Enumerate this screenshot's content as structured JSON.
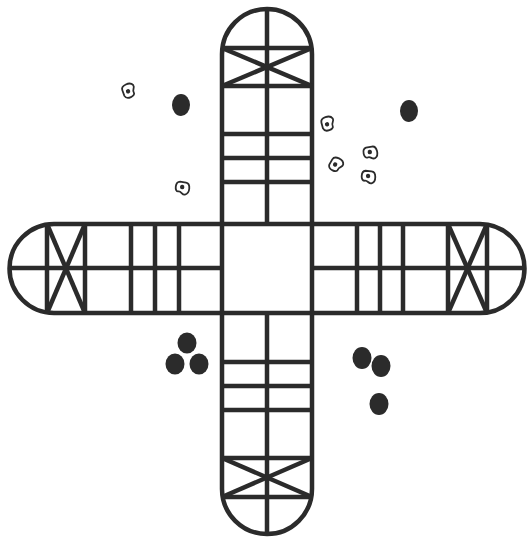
{
  "game": {
    "name": "Cross-and-circle race board (Pachisi style)",
    "board_color": "#2b2b2b",
    "background": "#ffffff"
  },
  "pieces": [
    {
      "group": "top-left",
      "count": 1
    },
    {
      "group": "top-right",
      "count": 1
    },
    {
      "group": "bottom-left",
      "count": 3
    },
    {
      "group": "bottom-right",
      "count": 3
    }
  ],
  "cowries": {
    "count": 7,
    "icon": "cowrie-shell-icon"
  }
}
